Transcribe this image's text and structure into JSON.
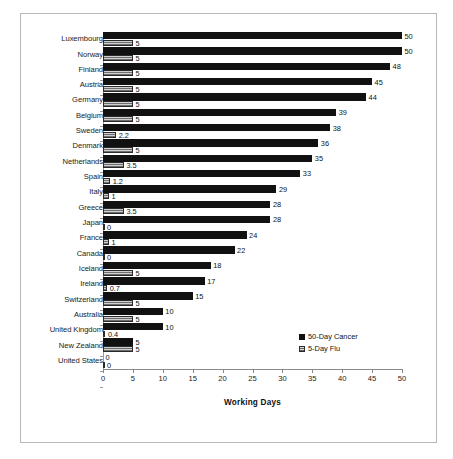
{
  "chart_data": {
    "type": "bar",
    "orientation": "horizontal",
    "title": "",
    "xlabel": "Working Days",
    "ylabel": "",
    "xlim": [
      0,
      50
    ],
    "xticks": [
      0,
      5,
      10,
      15,
      20,
      25,
      30,
      35,
      40,
      45,
      50
    ],
    "grid": false,
    "legend_position": "bottom-right",
    "categories": [
      "Luxembourg",
      "Norway",
      "Finland",
      "Austria",
      "Germany",
      "Belgium",
      "Sweden",
      "Denmark",
      "Netherlands",
      "Spain",
      "Italy",
      "Greece",
      "Japan",
      "France",
      "Canada",
      "Iceland",
      "Ireland",
      "Switzerland",
      "Australia",
      "United Kingdom",
      "New Zealand",
      "United States"
    ],
    "series": [
      {
        "name": "50-Day Cancer",
        "color": "#111111",
        "values": [
          50,
          50,
          48,
          45,
          44,
          39,
          38,
          36,
          35,
          33,
          29,
          28,
          28,
          24,
          22,
          18,
          17,
          15,
          10,
          10,
          5,
          0
        ],
        "labels": [
          "50",
          "50",
          "48",
          "45",
          "44",
          "39",
          "38",
          "36",
          "35",
          "33",
          "29",
          "28",
          "28",
          "24",
          "22",
          "18",
          "17",
          "15",
          "10",
          "10",
          "5",
          "0"
        ]
      },
      {
        "name": "5-Day Flu",
        "color": "#8f8f8f",
        "values": [
          5,
          5,
          5,
          5,
          5,
          5,
          2.2,
          5,
          3.5,
          1.2,
          1,
          3.5,
          0,
          1,
          0,
          5,
          0.7,
          5,
          5,
          0.4,
          5,
          0
        ],
        "labels": [
          "5",
          "5",
          "5",
          "5",
          "5",
          "5",
          "2.2",
          "5",
          "3.5",
          "1.2",
          "1",
          "3.5",
          "0",
          "1",
          "0",
          "5",
          "0.7",
          "5",
          "5",
          "0.4",
          "5",
          "0"
        ]
      }
    ]
  },
  "legend": {
    "items": [
      {
        "label": "50-Day Cancer",
        "swatch": "black-square"
      },
      {
        "label": "5-Day Flu",
        "swatch": "hatched-square"
      }
    ]
  },
  "axis": {
    "x_title": "Working Days",
    "x_tick_labels": [
      "0",
      "5",
      "10",
      "15",
      "20",
      "25",
      "30",
      "35",
      "40",
      "45",
      "50"
    ]
  }
}
